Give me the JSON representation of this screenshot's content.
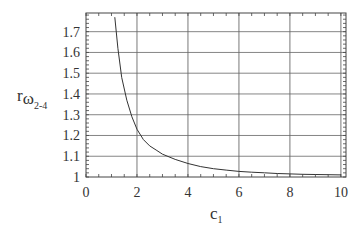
{
  "chart_data": {
    "type": "line",
    "title": "",
    "xlabel": "c1",
    "ylabel": "r_omega_2-4",
    "xlim": [
      0,
      10.2
    ],
    "ylim": [
      1.0,
      1.79
    ],
    "grid": true,
    "legend": null,
    "xticks": [
      0,
      2,
      4,
      6,
      8,
      10
    ],
    "xtick_labels": [
      "0",
      "2",
      "4",
      "6",
      "8",
      "10"
    ],
    "yticks": [
      1.0,
      1.1,
      1.2,
      1.3,
      1.4,
      1.5,
      1.6,
      1.7
    ],
    "ytick_labels": [
      "1",
      "1.1",
      "1.2",
      "1.3",
      "1.4",
      "1.5",
      "1.6",
      "1.7"
    ],
    "series": [
      {
        "name": "r_omega_2-4",
        "x": [
          1.13,
          1.25,
          1.4,
          1.6,
          1.8,
          2.0,
          2.25,
          2.5,
          2.75,
          3.0,
          3.5,
          4.0,
          4.5,
          5.0,
          5.5,
          6.0,
          6.5,
          7.0,
          7.5,
          8.0,
          8.5,
          9.0,
          9.5,
          10.0
        ],
        "y": [
          1.77,
          1.62,
          1.48,
          1.37,
          1.29,
          1.23,
          1.18,
          1.15,
          1.13,
          1.11,
          1.085,
          1.065,
          1.05,
          1.04,
          1.033,
          1.027,
          1.023,
          1.02,
          1.017,
          1.015,
          1.013,
          1.012,
          1.011,
          1.01
        ]
      }
    ]
  },
  "axis": {
    "xlabel_main": "c",
    "xlabel_sub": "1",
    "ylabel_main": "r",
    "ylabel_sub1": "ω",
    "ylabel_sub2": "2-4"
  }
}
